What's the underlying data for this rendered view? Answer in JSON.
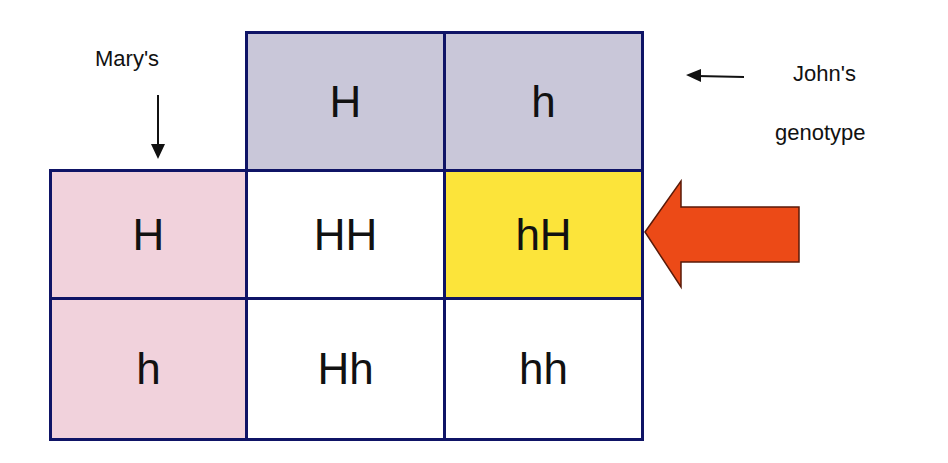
{
  "mother": {
    "label": "Mary's",
    "alleles": [
      "H",
      "h"
    ]
  },
  "father": {
    "label_line1": "John's",
    "label_line2": "genotype",
    "alleles": [
      "H",
      "h"
    ]
  },
  "grid": [
    [
      "HH",
      "hH"
    ],
    [
      "Hh",
      "hh"
    ]
  ],
  "highlighted_cell": "hH",
  "colors": {
    "border": "#0f1466",
    "father_header": "#c9c7d9",
    "mother_header": "#f1d2dc",
    "offspring": "#ffffff",
    "highlight": "#fce43a",
    "pointer_arrow": "#ec4a17",
    "pointer_arrow_outline": "#5a1a08"
  }
}
